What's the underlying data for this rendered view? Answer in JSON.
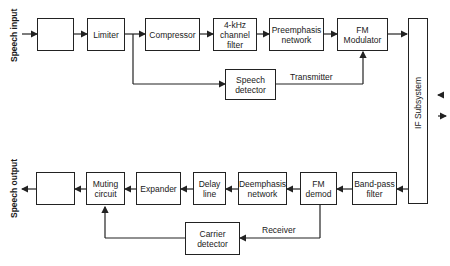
{
  "diagram": {
    "input_label": "Speech input",
    "output_label": "Speech output",
    "transmitter_label": "Transmitter",
    "receiver_label": "Receiver",
    "if_subsystem_label": "IF Subsystem",
    "transmit_chain": [
      {
        "id": "tx-amp",
        "label": "",
        "icon": "amplifier-right-icon"
      },
      {
        "id": "limiter",
        "label": "Limiter"
      },
      {
        "id": "compressor",
        "label": "Compressor"
      },
      {
        "id": "channel-filter",
        "label": "4-kHz channel filter"
      },
      {
        "id": "preemphasis",
        "label": "Preemphasis network"
      },
      {
        "id": "fm-modulator",
        "label": "FM Modulator"
      }
    ],
    "speech_detector": {
      "label": "Speech detector"
    },
    "receive_chain": [
      {
        "id": "rx-amp",
        "label": "",
        "icon": "amplifier-left-icon"
      },
      {
        "id": "muting",
        "label": "Muting circuit"
      },
      {
        "id": "expander",
        "label": "Expander"
      },
      {
        "id": "delay-line",
        "label": "Delay line"
      },
      {
        "id": "deemphasis",
        "label": "Deemphasis network"
      },
      {
        "id": "fm-demod",
        "label": "FM demod"
      },
      {
        "id": "bandpass",
        "label": "Band-pass filter"
      }
    ],
    "carrier_detector": {
      "label": "Carrier detector"
    }
  }
}
